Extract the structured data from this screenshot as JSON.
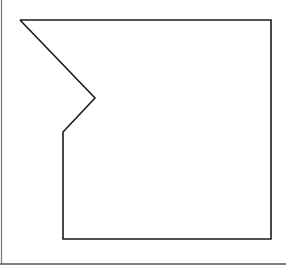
{
  "diagram": {
    "stroke_color": "#1a1a1a",
    "frame_color": "#555555",
    "background": "#ffffff",
    "shape": {
      "points": [
        [
          20,
          20
        ],
        [
          271,
          20
        ],
        [
          271,
          239
        ],
        [
          63,
          239
        ],
        [
          63,
          132
        ],
        [
          95,
          98
        ],
        [
          20,
          20
        ]
      ],
      "stroke_width": 1.6
    },
    "frame": {
      "left": {
        "x": 1.5,
        "y1": 0,
        "y2": 264
      },
      "bottom": {
        "y": 264,
        "x1": 0,
        "x2": 286
      },
      "stroke_width": 1.5
    }
  }
}
